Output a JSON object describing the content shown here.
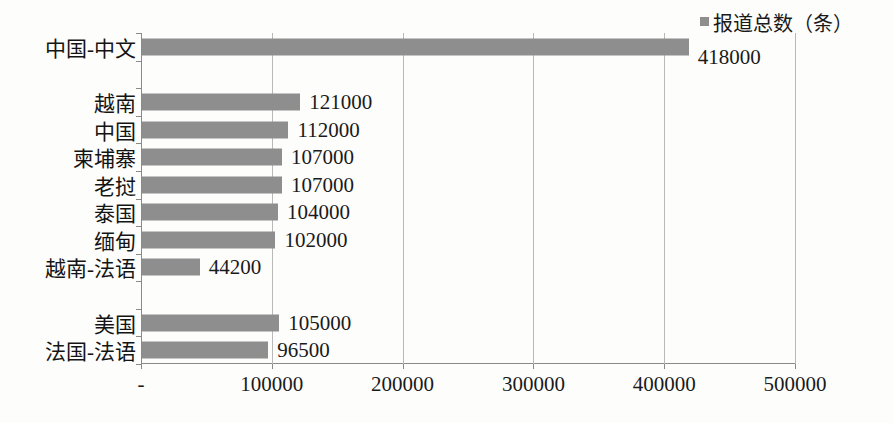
{
  "chart_data": {
    "type": "bar",
    "orientation": "horizontal",
    "title": "",
    "xlabel": "",
    "ylabel": "",
    "xlim": [
      0,
      500000
    ],
    "grid": true,
    "legend_position": "top-right",
    "legend": [
      "报道总数（条）"
    ],
    "series_name": "报道总数（条）",
    "bar_color": "#8e8e8e",
    "xticks": [
      {
        "value": 0,
        "label": "-"
      },
      {
        "value": 100000,
        "label": "100000"
      },
      {
        "value": 200000,
        "label": "200000"
      },
      {
        "value": 300000,
        "label": "300000"
      },
      {
        "value": 400000,
        "label": "400000"
      },
      {
        "value": 500000,
        "label": "500000"
      }
    ],
    "categories": [
      "中国-中文",
      "",
      "越南",
      "中国",
      "柬埔寨",
      "老挝",
      "泰国",
      "缅甸",
      "越南-法语",
      "",
      "美国",
      "法国-法语"
    ],
    "values": [
      418000,
      null,
      121000,
      112000,
      107000,
      107000,
      104000,
      102000,
      44200,
      null,
      105000,
      96500
    ],
    "data_labels": [
      "418000",
      "",
      "121000",
      "112000",
      "107000",
      "107000",
      "104000",
      "102000",
      "44200",
      "",
      "105000",
      "96500"
    ],
    "rows": [
      {
        "category": "中国-中文",
        "value": 418000,
        "label": "418000",
        "label_outside_plot": true
      },
      {
        "category": "",
        "value": null,
        "label": ""
      },
      {
        "category": "越南",
        "value": 121000,
        "label": "121000"
      },
      {
        "category": "中国",
        "value": 112000,
        "label": "112000"
      },
      {
        "category": "柬埔寨",
        "value": 107000,
        "label": "107000"
      },
      {
        "category": "老挝",
        "value": 107000,
        "label": "107000"
      },
      {
        "category": "泰国",
        "value": 104000,
        "label": "104000"
      },
      {
        "category": "缅甸",
        "value": 102000,
        "label": "102000"
      },
      {
        "category": "越南-法语",
        "value": 44200,
        "label": "44200"
      },
      {
        "category": "",
        "value": null,
        "label": ""
      },
      {
        "category": "美国",
        "value": 105000,
        "label": "105000"
      },
      {
        "category": "法国-法语",
        "value": 96500,
        "label": "96500"
      }
    ]
  }
}
